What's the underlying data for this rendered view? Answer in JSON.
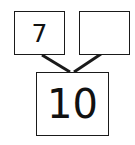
{
  "number_bond": {
    "part_left": "7",
    "part_right": "",
    "whole": "10"
  },
  "colors": {
    "stroke": "#1a1a1a",
    "background": "#ffffff"
  }
}
